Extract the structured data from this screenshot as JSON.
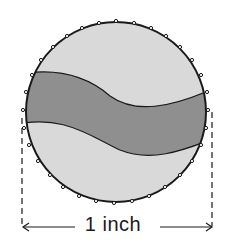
{
  "diagram": {
    "measurement_label": "1 inch",
    "colors": {
      "cap_fill": "#d9d9d9",
      "band_fill": "#8f8f8f",
      "outline": "#1a1a1a",
      "background": "#ffffff"
    },
    "elements": [
      "circular cap with crimped edge",
      "wavy dark band across cap",
      "dashed extension lines at left and right edges",
      "double arrow dimension indicating diameter"
    ]
  }
}
